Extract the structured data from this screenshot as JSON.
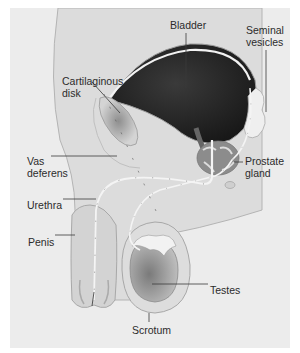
{
  "figure": {
    "background": "#ececec",
    "labels": {
      "bladder": "Bladder",
      "seminal_vesicles": "Seminal\nvesicles",
      "cartilaginous_disk": "Cartilaginous\ndisk",
      "prostate_gland": "Prostate\ngland",
      "vas_deferens": "Vas\ndeferens",
      "urethra": "Urethra",
      "penis": "Penis",
      "testes": "Testes",
      "scrotum": "Scrotum"
    },
    "colors": {
      "bladder": "#2a2a2a",
      "body_tissue": "#d9d9d9",
      "outline": "#a8a8a8",
      "duct": "#f4f4f4",
      "testis": "#9a9a9a",
      "label_text": "#2b2b2b"
    }
  }
}
